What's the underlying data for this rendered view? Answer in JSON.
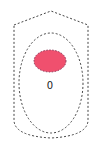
{
  "diagram": {
    "outer_shape": {
      "type": "rounded-hexagon",
      "stroke": "#444444",
      "dashed": true
    },
    "inner_shape": {
      "type": "ellipse",
      "stroke": "#444444",
      "dashed": true
    },
    "core": {
      "type": "ellipse",
      "fill": "#f0506e",
      "stroke": "#8a3a5a",
      "dashed": true
    },
    "label": "0"
  }
}
